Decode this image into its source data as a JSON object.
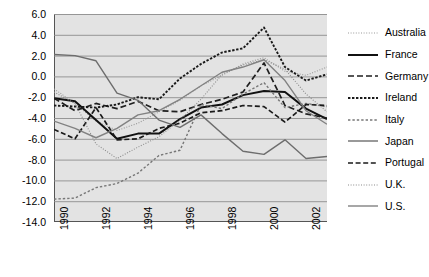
{
  "chart_data": {
    "type": "line",
    "title": "",
    "xlabel": "",
    "ylabel": "",
    "xlim": [
      1990,
      2003
    ],
    "ylim": [
      -14.0,
      6.0
    ],
    "grid": true,
    "legend_position": "right",
    "x": [
      1990,
      1991,
      1992,
      1993,
      1994,
      1995,
      1996,
      1997,
      1998,
      1999,
      2000,
      2001,
      2002,
      2003
    ],
    "xtick_labels": [
      "1990",
      "1992",
      "1994",
      "1996",
      "1998",
      "2000",
      "2002"
    ],
    "xtick_values": [
      1990,
      1992,
      1994,
      1996,
      1998,
      2000,
      2002
    ],
    "ytick_labels": [
      "6.0",
      "4.0",
      "2.0",
      "0.0",
      "-2.0",
      "-4.0",
      "-6.0",
      "-8.0",
      "-10.0",
      "-12.0",
      "-14.0"
    ],
    "ytick_values": [
      6.0,
      4.0,
      2.0,
      0.0,
      -2.0,
      -4.0,
      -6.0,
      -8.0,
      -10.0,
      -12.0,
      -14.0
    ],
    "series": [
      {
        "name": "Australia",
        "style": "dotted-fine",
        "color": "#9a9a9a",
        "values": [
          -1.2,
          -2.6,
          -4.3,
          -5.2,
          -4.5,
          -3.4,
          -2.3,
          -0.9,
          0.1,
          1.2,
          1.8,
          0.5,
          0.1,
          0.9
        ]
      },
      {
        "name": "France",
        "style": "solid-thick",
        "color": "#111111",
        "values": [
          -2.1,
          -2.4,
          -4.2,
          -6.0,
          -5.5,
          -5.5,
          -4.1,
          -3.0,
          -2.7,
          -1.8,
          -1.4,
          -1.5,
          -3.1,
          -4.1
        ]
      },
      {
        "name": "Germany",
        "style": "dashed-long",
        "color": "#1f1f1f",
        "values": [
          -2.1,
          -3.3,
          -2.6,
          -3.1,
          -2.4,
          -3.3,
          -3.4,
          -2.7,
          -2.2,
          -1.5,
          1.3,
          -2.8,
          -3.6,
          -4.0
        ]
      },
      {
        "name": "Ireland",
        "style": "dotted-dense",
        "color": "#1a1a1a",
        "values": [
          -2.8,
          -2.9,
          -3.0,
          -2.7,
          -2.0,
          -2.2,
          -0.2,
          1.2,
          2.3,
          2.7,
          4.7,
          0.9,
          -0.4,
          0.2
        ]
      },
      {
        "name": "Italy",
        "style": "dotted-medium",
        "color": "#777777",
        "values": [
          -11.8,
          -11.7,
          -10.7,
          -10.3,
          -9.3,
          -7.6,
          -7.1,
          -2.7,
          -3.1,
          -1.7,
          -0.6,
          -3.0,
          -2.6,
          -2.9
        ]
      },
      {
        "name": "Japan",
        "style": "solid-thin",
        "color": "#6d6d6d",
        "values": [
          2.1,
          2.0,
          1.5,
          -1.6,
          -2.3,
          -4.2,
          -4.9,
          -3.7,
          -5.5,
          -7.2,
          -7.5,
          -6.1,
          -7.9,
          -7.7
        ]
      },
      {
        "name": "Portugal",
        "style": "dashed-medium",
        "color": "#1a1a1a",
        "values": [
          -5.1,
          -6.0,
          -3.0,
          -6.1,
          -6.0,
          -5.0,
          -4.5,
          -3.5,
          -3.3,
          -2.8,
          -2.9,
          -4.4,
          -2.7,
          -2.8
        ]
      },
      {
        "name": "U.K.",
        "style": "dotted-fine",
        "color": "#8a8a8a",
        "values": [
          -1.5,
          -2.6,
          -6.5,
          -7.9,
          -6.8,
          -5.8,
          -4.2,
          -2.2,
          0.2,
          1.1,
          1.6,
          0.7,
          -1.7,
          -3.4
        ]
      },
      {
        "name": "U.S.",
        "style": "solid-gray",
        "color": "#828282",
        "values": [
          -4.3,
          -5.0,
          -5.9,
          -5.0,
          -3.7,
          -3.3,
          -2.2,
          -0.9,
          0.4,
          0.9,
          1.6,
          -0.4,
          -3.3,
          -4.6
        ]
      }
    ]
  },
  "legend": {
    "items": [
      {
        "label": "Australia"
      },
      {
        "label": "France"
      },
      {
        "label": "Germany"
      },
      {
        "label": "Ireland"
      },
      {
        "label": "Italy"
      },
      {
        "label": "Japan"
      },
      {
        "label": "Portugal"
      },
      {
        "label": "U.K."
      },
      {
        "label": "U.S."
      }
    ]
  },
  "colors": {
    "plot_background": "#e3e3e3",
    "gridline": "#8d8d8d",
    "axis": "#555555",
    "page_background": "#ffffff"
  }
}
